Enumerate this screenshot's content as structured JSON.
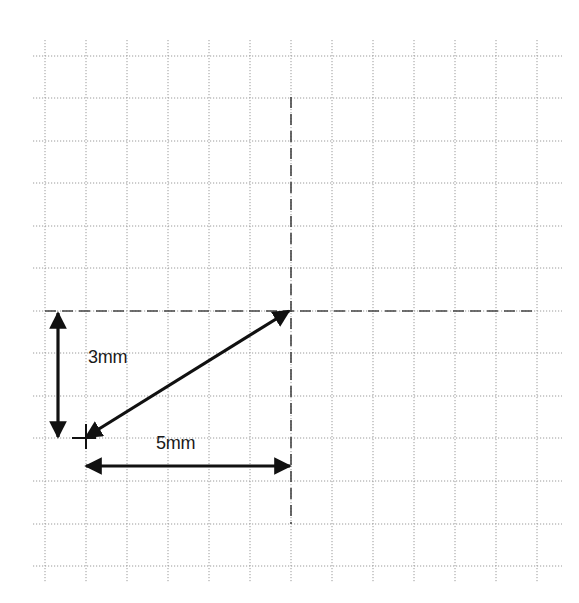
{
  "diagram": {
    "type": "vector-measurement-on-grid",
    "background_color": "#ffffff",
    "grid": {
      "style": "dotted",
      "color": "#9a9a9a",
      "vertical_lines_x": [
        45,
        86,
        127,
        168,
        209,
        250,
        291,
        332,
        373,
        414,
        455,
        496,
        537
      ],
      "horizontal_lines_y": [
        56,
        98,
        141,
        183,
        226,
        268,
        311,
        353,
        396,
        438,
        481,
        524,
        566
      ],
      "x_extent": [
        33,
        562
      ],
      "y_extent": [
        40,
        582
      ]
    },
    "reference_lines": [
      {
        "name": "horizontal-dashed-reference",
        "orientation": "horizontal",
        "y": 311,
        "x_from": 45,
        "x_to": 532
      },
      {
        "name": "vertical-dashed-reference",
        "orientation": "vertical",
        "x": 291,
        "y_from": 97,
        "y_to": 524
      }
    ],
    "arrows": [
      {
        "name": "vertical-dimension-arrow",
        "from": [
          58,
          313
        ],
        "to": [
          58,
          437
        ],
        "double_headed": true
      },
      {
        "name": "horizontal-dimension-arrow",
        "from": [
          86,
          466
        ],
        "to": [
          290,
          466
        ],
        "double_headed": true
      },
      {
        "name": "diagonal-vector-arrow",
        "from": [
          289,
          311
        ],
        "to": [
          86,
          437
        ],
        "double_headed": true
      }
    ],
    "marker": {
      "name": "origin-cross-marker",
      "x": 86,
      "y": 438
    },
    "labels": {
      "vertical_dimension": "3mm",
      "horizontal_dimension": "5mm"
    },
    "stroke_color": "#111111",
    "dashed_color": "#444444"
  }
}
